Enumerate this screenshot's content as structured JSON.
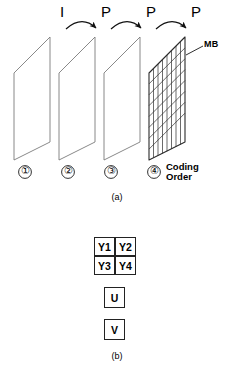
{
  "figure": {
    "title_internal": "Video coding frame structure and macroblock layout",
    "panel_a": {
      "caption": "(a)",
      "frame_types": [
        "I",
        "P",
        "P",
        "P"
      ],
      "coding_order_numbers": [
        "①",
        "②",
        "③",
        "④"
      ],
      "coding_order_label_line1": "Coding",
      "coding_order_label_line2": "Order",
      "macroblock_label": "MB",
      "grid": {
        "rows": 8,
        "cols": 8
      },
      "frame_count": 4,
      "arrow_count": 3,
      "line_color": "#3a3a3a",
      "grid_color": "#2b2b2b",
      "arrow_color": "#1a1a1a"
    },
    "panel_b": {
      "caption": "(b)",
      "luma_blocks": [
        [
          "Y1",
          "Y2"
        ],
        [
          "Y3",
          "Y4"
        ]
      ],
      "chroma_blocks": [
        "U",
        "V"
      ],
      "box_border_color": "#222222"
    }
  }
}
